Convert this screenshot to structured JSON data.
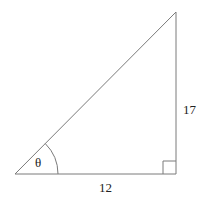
{
  "diagram": {
    "type": "right-triangle",
    "labels": {
      "angle": "θ",
      "vertical_side": "17",
      "horizontal_side": "12"
    },
    "colors": {
      "stroke": "#7a7a7a",
      "text": "#222222",
      "background": "#ffffff"
    }
  }
}
